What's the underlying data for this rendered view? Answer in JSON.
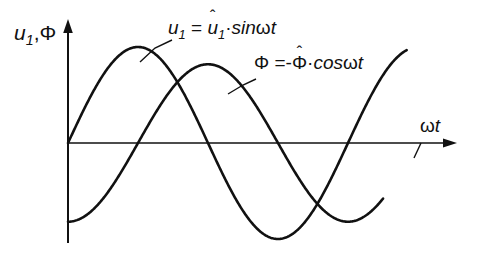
{
  "figure": {
    "background_color": "#ffffff",
    "line_color": "#111111"
  },
  "axes": {
    "y_label_parts": {
      "u": "u",
      "sub": "1",
      "comma": ",",
      "phi": "Φ"
    },
    "y_label_text": "u1,Φ",
    "x_label_parts": {
      "omega": "ω",
      "t": "t"
    },
    "x_label_text": "ωt",
    "x_arrow": "arrow-right",
    "y_arrow": "arrow-up"
  },
  "annotations": [
    {
      "id": "u1-equation",
      "text": "u1 = û1·sin ωt",
      "parts": {
        "lhs_var": "u",
        "lhs_sub": "1",
        "equals": "=",
        "amp_var": "u",
        "amp_hat": "ˆ",
        "amp_sub": "1",
        "dot": "·",
        "func": "sin",
        "omega": "ω",
        "t": "t"
      },
      "leader_line": true
    },
    {
      "id": "phi-equation",
      "text": "Φ = -Φ̂·cos ωt",
      "parts": {
        "lhs_var": "Φ",
        "equals": "=",
        "minus": "-",
        "amp_var": "Φ",
        "amp_hat": "ˆ",
        "dot": "·",
        "func": "cos",
        "omega": "ω",
        "t": "t"
      },
      "leader_line": true
    }
  ],
  "chart_data": {
    "type": "line",
    "title": "",
    "xlabel": "ωt",
    "ylabel": "u1,Φ",
    "grid": false,
    "legend": "inline-annotations",
    "xlim": [
      0,
      7.54
    ],
    "ylim": [
      -1.1,
      1.1
    ],
    "x_unit": "radians",
    "x_tick_labels": [],
    "y_tick_labels": [],
    "series": [
      {
        "name": "u1",
        "label": "u1 = û1·sin ωt",
        "formula": "sin(x)",
        "amplitude": 1.0,
        "phase_deg": 0,
        "color": "#111111",
        "zero_crossings_rad": [
          0,
          3.1416,
          6.2832
        ],
        "maxima_rad": [
          1.5708
        ],
        "minima_rad": [
          4.7124
        ],
        "x": [
          0,
          0.2618,
          0.5236,
          0.7854,
          1.0472,
          1.309,
          1.5708,
          1.8326,
          2.0944,
          2.3562,
          2.618,
          2.8798,
          3.1416,
          3.4034,
          3.6652,
          3.927,
          4.1888,
          4.4506,
          4.7124,
          4.9742,
          5.236,
          5.4978,
          5.7596,
          6.0214,
          6.2832,
          6.545,
          6.8068,
          7.0686,
          7.3304,
          7.5922
        ],
        "y": [
          0,
          0.259,
          0.5,
          0.707,
          0.866,
          0.966,
          1.0,
          0.966,
          0.866,
          0.707,
          0.5,
          0.259,
          0,
          -0.259,
          -0.5,
          -0.707,
          -0.866,
          -0.966,
          -1.0,
          -0.966,
          -0.866,
          -0.707,
          -0.5,
          -0.259,
          0,
          0.259,
          0.5,
          0.707,
          0.866,
          0.966
        ]
      },
      {
        "name": "Φ",
        "label": "Φ = -Φ̂·cos ωt",
        "formula": "-cos(x)",
        "amplitude": 0.82,
        "phase_deg": -90,
        "color": "#111111",
        "zero_crossings_rad": [
          1.5708,
          4.7124,
          7.854
        ],
        "maxima_rad": [
          3.1416
        ],
        "minima_rad": [
          0,
          6.2832
        ],
        "x": [
          0,
          0.2618,
          0.5236,
          0.7854,
          1.0472,
          1.309,
          1.5708,
          1.8326,
          2.0944,
          2.3562,
          2.618,
          2.8798,
          3.1416,
          3.4034,
          3.6652,
          3.927,
          4.1888,
          4.4506,
          4.7124,
          4.9742,
          5.236,
          5.4978,
          5.7596,
          6.0214,
          6.2832,
          6.545,
          6.8068,
          7.0686,
          7.3304,
          7.5922
        ],
        "y": [
          -1.0,
          -0.966,
          -0.866,
          -0.707,
          -0.5,
          -0.259,
          0,
          0.259,
          0.5,
          0.707,
          0.866,
          0.966,
          1.0,
          0.966,
          0.866,
          0.707,
          0.5,
          0.259,
          0,
          -0.259,
          -0.5,
          -0.707,
          -0.866,
          -0.966,
          -1.0,
          -0.966,
          -0.866,
          -0.707,
          -0.5,
          -0.259
        ]
      }
    ]
  }
}
